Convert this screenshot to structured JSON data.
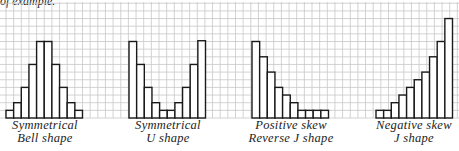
{
  "top_text": "of example.",
  "grid": {
    "spacing": 7.65,
    "color": "#c8c8c8",
    "top": 2,
    "baseline": 118
  },
  "chart_data": [
    {
      "type": "bar",
      "title": "Symmetrical",
      "subtitle": "Bell shape",
      "values": [
        1,
        2,
        4,
        7,
        10,
        10,
        7,
        4,
        2,
        1
      ],
      "x_start": 6
    },
    {
      "type": "bar",
      "title": "Symmetrical",
      "subtitle": "U shape",
      "values": [
        10,
        7,
        4,
        2,
        1,
        1,
        2,
        4,
        7,
        10.1
      ],
      "x_start": 129
    },
    {
      "type": "bar",
      "title": "Positive skew",
      "subtitle": "Reverse J shape",
      "values": [
        10,
        8,
        6,
        4,
        3,
        2,
        1,
        1,
        1,
        1
      ],
      "x_start": 252
    },
    {
      "type": "bar",
      "title": "Negative skew",
      "subtitle": "J shape",
      "values": [
        1,
        1,
        2,
        3,
        4,
        5,
        6,
        8,
        10,
        13
      ],
      "x_start": 376
    }
  ],
  "labels": [
    {
      "line1": "Symmetrical",
      "line2": "Bell shape"
    },
    {
      "line1": "Symmetrical",
      "line2": "U shape"
    },
    {
      "line1": "Positive skew",
      "line2": "Reverse J shape"
    },
    {
      "line1": "Negative skew",
      "line2": "J shape"
    }
  ]
}
